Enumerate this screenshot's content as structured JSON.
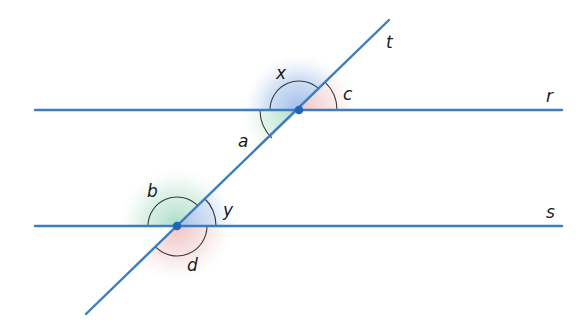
{
  "diagram": {
    "colors": {
      "line": "#3b7cc2",
      "dot": "#1f66b8",
      "blue_region": "#8fb3e6",
      "green_region": "#a9dcc4",
      "pink_region": "#efc0c0",
      "arc": "#3a3a3a",
      "label": "#1a1a1a"
    },
    "lines": [
      {
        "name": "r",
        "label": "r",
        "x1": 35,
        "y1": 110,
        "x2": 562,
        "y2": 110,
        "label_x": 546,
        "label_y": 102
      },
      {
        "name": "s",
        "label": "s",
        "x1": 35,
        "y1": 226,
        "x2": 562,
        "y2": 226,
        "label_x": 546,
        "label_y": 218
      },
      {
        "name": "t",
        "label": "t",
        "x1": 86,
        "y1": 314,
        "x2": 389,
        "y2": 20,
        "label_x": 386,
        "label_y": 48
      }
    ],
    "intersections": [
      {
        "name": "r-t",
        "x": 299,
        "y": 110
      },
      {
        "name": "s-t",
        "x": 177,
        "y": 226
      }
    ],
    "angles": [
      {
        "label": "x",
        "at": "r-t",
        "label_x": 278,
        "label_y": 78
      },
      {
        "label": "c",
        "at": "r-t",
        "label_x": 344,
        "label_y": 99
      },
      {
        "label": "a",
        "at": "r-t",
        "label_x": 240,
        "label_y": 146
      },
      {
        "label": "b",
        "at": "s-t",
        "label_x": 148,
        "label_y": 196
      },
      {
        "label": "y",
        "at": "s-t",
        "label_x": 224,
        "label_y": 215
      },
      {
        "label": "d",
        "at": "s-t",
        "label_x": 188,
        "label_y": 270
      }
    ]
  }
}
